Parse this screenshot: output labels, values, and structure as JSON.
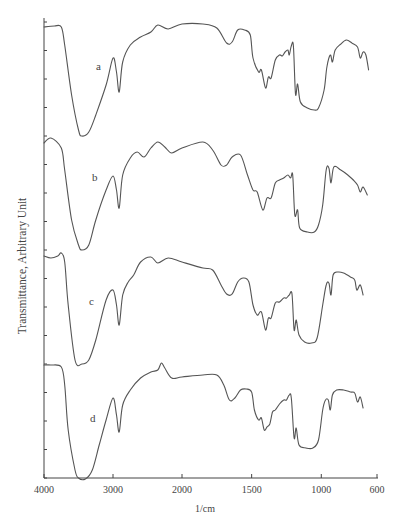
{
  "chart_data": {
    "type": "line",
    "title": "",
    "xlabel": "1/cm",
    "ylabel": "Transmittance, Arbitrary Unit",
    "x_ticks": [
      4000,
      3000,
      2000,
      1500,
      1000,
      600
    ],
    "x_tick_labels": [
      "4000",
      "3000",
      "2000",
      "1500",
      "1000",
      "600"
    ],
    "x_axis_reversed": true,
    "x_scale_note": "scale doubles below 2000 1/cm",
    "xlim": [
      4000,
      600
    ],
    "y_ticks_count": 17,
    "y_tick_labels": [],
    "grid": false,
    "legend": "inline curve letters",
    "units_note": "y values are pixel rows (smaller = higher transmittance)",
    "series": [
      {
        "name": "a",
        "label_pos": [
          96,
          67
        ],
        "points": [
          [
            4000,
            27
          ],
          [
            3850,
            26
          ],
          [
            3750,
            27
          ],
          [
            3700,
            45
          ],
          [
            3600,
            95
          ],
          [
            3500,
            130
          ],
          [
            3450,
            136
          ],
          [
            3350,
            132
          ],
          [
            3250,
            115
          ],
          [
            3100,
            85
          ],
          [
            3000,
            58
          ],
          [
            2950,
            72
          ],
          [
            2910,
            92
          ],
          [
            2860,
            62
          ],
          [
            2750,
            45
          ],
          [
            2600,
            37
          ],
          [
            2450,
            32
          ],
          [
            2350,
            25
          ],
          [
            2200,
            29
          ],
          [
            2000,
            24
          ],
          [
            1850,
            24
          ],
          [
            1750,
            28
          ],
          [
            1680,
            43
          ],
          [
            1640,
            42
          ],
          [
            1600,
            30
          ],
          [
            1550,
            30
          ],
          [
            1510,
            35
          ],
          [
            1490,
            58
          ],
          [
            1450,
            72
          ],
          [
            1430,
            70
          ],
          [
            1400,
            88
          ],
          [
            1380,
            77
          ],
          [
            1360,
            78
          ],
          [
            1330,
            60
          ],
          [
            1300,
            55
          ],
          [
            1280,
            56
          ],
          [
            1260,
            52
          ],
          [
            1240,
            50
          ],
          [
            1230,
            55
          ],
          [
            1215,
            46
          ],
          [
            1200,
            46
          ],
          [
            1185,
            94
          ],
          [
            1170,
            84
          ],
          [
            1150,
            102
          ],
          [
            1100,
            108
          ],
          [
            1050,
            110
          ],
          [
            1020,
            108
          ],
          [
            980,
            90
          ],
          [
            960,
            67
          ],
          [
            935,
            55
          ],
          [
            920,
            62
          ],
          [
            900,
            50
          ],
          [
            860,
            44
          ],
          [
            820,
            40
          ],
          [
            780,
            43
          ],
          [
            740,
            47
          ],
          [
            720,
            58
          ],
          [
            700,
            52
          ],
          [
            680,
            55
          ],
          [
            660,
            70
          ]
        ]
      },
      {
        "name": "b",
        "label_pos": [
          92,
          178
        ],
        "points": [
          [
            4000,
            143
          ],
          [
            3900,
            138
          ],
          [
            3750,
            148
          ],
          [
            3700,
            170
          ],
          [
            3600,
            220
          ],
          [
            3500,
            245
          ],
          [
            3450,
            250
          ],
          [
            3350,
            245
          ],
          [
            3250,
            220
          ],
          [
            3100,
            190
          ],
          [
            3000,
            176
          ],
          [
            2950,
            190
          ],
          [
            2910,
            208
          ],
          [
            2860,
            175
          ],
          [
            2750,
            158
          ],
          [
            2650,
            152
          ],
          [
            2550,
            157
          ],
          [
            2450,
            148
          ],
          [
            2350,
            142
          ],
          [
            2250,
            147
          ],
          [
            2150,
            153
          ],
          [
            2000,
            148
          ],
          [
            1850,
            142
          ],
          [
            1780,
            150
          ],
          [
            1720,
            165
          ],
          [
            1680,
            165
          ],
          [
            1640,
            157
          ],
          [
            1580,
            155
          ],
          [
            1530,
            175
          ],
          [
            1490,
            190
          ],
          [
            1460,
            192
          ],
          [
            1420,
            210
          ],
          [
            1390,
            198
          ],
          [
            1360,
            198
          ],
          [
            1330,
            183
          ],
          [
            1300,
            180
          ],
          [
            1270,
            178
          ],
          [
            1240,
            175
          ],
          [
            1220,
            178
          ],
          [
            1205,
            175
          ],
          [
            1190,
            215
          ],
          [
            1170,
            210
          ],
          [
            1155,
            228
          ],
          [
            1100,
            232
          ],
          [
            1050,
            232
          ],
          [
            1020,
            225
          ],
          [
            990,
            205
          ],
          [
            965,
            170
          ],
          [
            945,
            168
          ],
          [
            930,
            183
          ],
          [
            910,
            167
          ],
          [
            860,
            170
          ],
          [
            810,
            175
          ],
          [
            770,
            180
          ],
          [
            740,
            185
          ],
          [
            720,
            192
          ],
          [
            700,
            187
          ],
          [
            670,
            195
          ]
        ]
      },
      {
        "name": "c",
        "label_pos": [
          89,
          302
        ],
        "points": [
          [
            4000,
            256
          ],
          [
            3900,
            258
          ],
          [
            3800,
            256
          ],
          [
            3750,
            253
          ],
          [
            3700,
            262
          ],
          [
            3650,
            305
          ],
          [
            3550,
            360
          ],
          [
            3450,
            364
          ],
          [
            3350,
            360
          ],
          [
            3250,
            340
          ],
          [
            3100,
            300
          ],
          [
            3000,
            290
          ],
          [
            2950,
            305
          ],
          [
            2910,
            325
          ],
          [
            2860,
            295
          ],
          [
            2780,
            282
          ],
          [
            2700,
            275
          ],
          [
            2600,
            262
          ],
          [
            2450,
            257
          ],
          [
            2350,
            263
          ],
          [
            2200,
            258
          ],
          [
            2000,
            262
          ],
          [
            1850,
            268
          ],
          [
            1780,
            270
          ],
          [
            1720,
            285
          ],
          [
            1680,
            294
          ],
          [
            1640,
            294
          ],
          [
            1600,
            282
          ],
          [
            1560,
            278
          ],
          [
            1520,
            282
          ],
          [
            1490,
            305
          ],
          [
            1460,
            315
          ],
          [
            1430,
            312
          ],
          [
            1400,
            330
          ],
          [
            1380,
            318
          ],
          [
            1360,
            318
          ],
          [
            1330,
            303
          ],
          [
            1300,
            302
          ],
          [
            1270,
            298
          ],
          [
            1250,
            298
          ],
          [
            1230,
            295
          ],
          [
            1210,
            294
          ],
          [
            1195,
            330
          ],
          [
            1180,
            320
          ],
          [
            1160,
            335
          ],
          [
            1120,
            342
          ],
          [
            1070,
            343
          ],
          [
            1030,
            338
          ],
          [
            990,
            305
          ],
          [
            965,
            285
          ],
          [
            945,
            283
          ],
          [
            930,
            295
          ],
          [
            915,
            275
          ],
          [
            880,
            272
          ],
          [
            840,
            273
          ],
          [
            790,
            277
          ],
          [
            760,
            280
          ],
          [
            745,
            290
          ],
          [
            720,
            285
          ],
          [
            700,
            295
          ]
        ]
      },
      {
        "name": "d",
        "label_pos": [
          90,
          419
        ],
        "points": [
          [
            4000,
            365
          ],
          [
            3900,
            365
          ],
          [
            3750,
            367
          ],
          [
            3700,
            385
          ],
          [
            3650,
            430
          ],
          [
            3550,
            470
          ],
          [
            3500,
            478
          ],
          [
            3400,
            479
          ],
          [
            3300,
            470
          ],
          [
            3200,
            445
          ],
          [
            3100,
            420
          ],
          [
            3000,
            398
          ],
          [
            2950,
            415
          ],
          [
            2910,
            432
          ],
          [
            2860,
            405
          ],
          [
            2750,
            390
          ],
          [
            2600,
            378
          ],
          [
            2450,
            372
          ],
          [
            2350,
            370
          ],
          [
            2300,
            363
          ],
          [
            2250,
            368
          ],
          [
            2150,
            378
          ],
          [
            2000,
            377
          ],
          [
            1850,
            375
          ],
          [
            1750,
            375
          ],
          [
            1700,
            385
          ],
          [
            1660,
            400
          ],
          [
            1620,
            398
          ],
          [
            1580,
            390
          ],
          [
            1540,
            389
          ],
          [
            1500,
            392
          ],
          [
            1480,
            410
          ],
          [
            1450,
            420
          ],
          [
            1430,
            418
          ],
          [
            1410,
            430
          ],
          [
            1390,
            427
          ],
          [
            1370,
            424
          ],
          [
            1350,
            412
          ],
          [
            1330,
            410
          ],
          [
            1300,
            404
          ],
          [
            1270,
            400
          ],
          [
            1250,
            400
          ],
          [
            1230,
            395
          ],
          [
            1215,
            398
          ],
          [
            1195,
            438
          ],
          [
            1180,
            428
          ],
          [
            1160,
            445
          ],
          [
            1110,
            448
          ],
          [
            1060,
            448
          ],
          [
            1020,
            440
          ],
          [
            990,
            410
          ],
          [
            970,
            400
          ],
          [
            950,
            400
          ],
          [
            935,
            410
          ],
          [
            920,
            395
          ],
          [
            890,
            390
          ],
          [
            840,
            390
          ],
          [
            790,
            392
          ],
          [
            760,
            393
          ],
          [
            740,
            402
          ],
          [
            720,
            397
          ],
          [
            700,
            408
          ]
        ]
      }
    ]
  }
}
